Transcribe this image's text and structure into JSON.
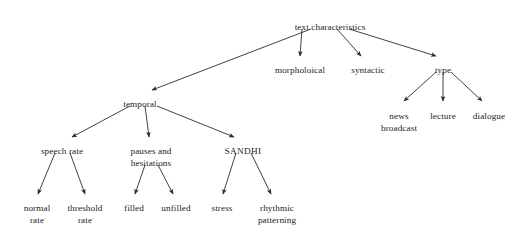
{
  "diagram": {
    "title": "text characteristics",
    "type": "hierarchical-tree",
    "background_color": "#ffffff",
    "text_color": "#1c1c1c",
    "edge_color": "#2b2b2b",
    "nodes": [
      {
        "id": "root",
        "label": "text characteristics",
        "line2": "",
        "x": 330,
        "y": 22,
        "level": 0
      },
      {
        "id": "temporal",
        "label": "temporal",
        "line2": "",
        "x": 140,
        "y": 99,
        "level": 1
      },
      {
        "id": "morpholoical",
        "label": "morpholoical",
        "line2": "",
        "x": 300,
        "y": 65,
        "level": 1
      },
      {
        "id": "syntactic",
        "label": "syntactic",
        "line2": "",
        "x": 368,
        "y": 65,
        "level": 1
      },
      {
        "id": "type",
        "label": "type",
        "line2": "",
        "x": 443,
        "y": 65,
        "level": 1
      },
      {
        "id": "news-broadcast",
        "label": "news",
        "line2": "broadcast",
        "x": 399,
        "y": 111,
        "level": 2
      },
      {
        "id": "lecture",
        "label": "lecture",
        "line2": "",
        "x": 443,
        "y": 111,
        "level": 2
      },
      {
        "id": "dialogue",
        "label": "dialogue",
        "line2": "",
        "x": 489,
        "y": 111,
        "level": 2
      },
      {
        "id": "speech-rate",
        "label": "speech rate",
        "line2": "",
        "x": 62,
        "y": 146,
        "level": 2
      },
      {
        "id": "pauses",
        "label": "pauses and",
        "line2": "hesitations",
        "x": 151,
        "y": 146,
        "level": 2
      },
      {
        "id": "sandhi",
        "label": "SANDHI",
        "line2": "",
        "x": 243,
        "y": 146,
        "level": 2
      },
      {
        "id": "normal-rate",
        "label": "normal",
        "line2": "rate",
        "x": 37,
        "y": 203,
        "level": 3
      },
      {
        "id": "threshold-rate",
        "label": "threshold",
        "line2": "rate",
        "x": 85,
        "y": 203,
        "level": 3
      },
      {
        "id": "filled",
        "label": "filled",
        "line2": "",
        "x": 134,
        "y": 203,
        "level": 3
      },
      {
        "id": "unfilled",
        "label": "unfilled",
        "line2": "",
        "x": 176,
        "y": 203,
        "level": 3
      },
      {
        "id": "stress",
        "label": "stress",
        "line2": "",
        "x": 222,
        "y": 203,
        "level": 3
      },
      {
        "id": "rhythmic",
        "label": "rhythmic",
        "line2": "patterning",
        "x": 277,
        "y": 203,
        "level": 3
      }
    ],
    "edges": [
      {
        "from": "root",
        "to": "temporal",
        "x1": 311,
        "y1": 29,
        "x2": 152,
        "y2": 90
      },
      {
        "from": "root",
        "to": "morpholoical",
        "x1": 302,
        "y1": 29,
        "x2": 300,
        "y2": 56
      },
      {
        "from": "root",
        "to": "syntactic",
        "x1": 337,
        "y1": 29,
        "x2": 361,
        "y2": 56
      },
      {
        "from": "root",
        "to": "type",
        "x1": 349,
        "y1": 29,
        "x2": 436,
        "y2": 56
      },
      {
        "from": "type",
        "to": "news-broadcast",
        "x1": 436,
        "y1": 72,
        "x2": 404,
        "y2": 101
      },
      {
        "from": "type",
        "to": "lecture",
        "x1": 443,
        "y1": 72,
        "x2": 443,
        "y2": 101
      },
      {
        "from": "type",
        "to": "dialogue",
        "x1": 451,
        "y1": 72,
        "x2": 482,
        "y2": 101
      },
      {
        "from": "temporal",
        "to": "speech-rate",
        "x1": 130,
        "y1": 106,
        "x2": 72,
        "y2": 137
      },
      {
        "from": "temporal",
        "to": "pauses",
        "x1": 145,
        "y1": 106,
        "x2": 149,
        "y2": 137
      },
      {
        "from": "temporal",
        "to": "sandhi",
        "x1": 157,
        "y1": 106,
        "x2": 234,
        "y2": 137
      },
      {
        "from": "speech-rate",
        "to": "normal-rate",
        "x1": 55,
        "y1": 153,
        "x2": 38,
        "y2": 194
      },
      {
        "from": "speech-rate",
        "to": "threshold-rate",
        "x1": 70,
        "y1": 153,
        "x2": 85,
        "y2": 194
      },
      {
        "from": "pauses",
        "to": "filled",
        "x1": 145,
        "y1": 165,
        "x2": 135,
        "y2": 194
      },
      {
        "from": "pauses",
        "to": "unfilled",
        "x1": 158,
        "y1": 165,
        "x2": 173,
        "y2": 194
      },
      {
        "from": "sandhi",
        "to": "stress",
        "x1": 236,
        "y1": 153,
        "x2": 223,
        "y2": 194
      },
      {
        "from": "sandhi",
        "to": "rhythmic",
        "x1": 251,
        "y1": 153,
        "x2": 271,
        "y2": 194
      }
    ]
  }
}
